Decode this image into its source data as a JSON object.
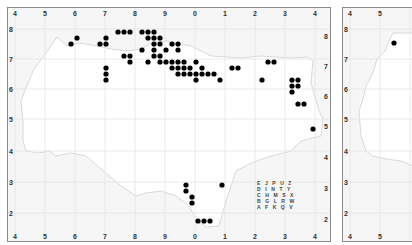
{
  "chart_data": {
    "type": "scatter",
    "title": "",
    "xlabel": "",
    "ylabel": "",
    "x_ticks": [
      "4",
      "5",
      "6",
      "7",
      "8",
      "9",
      "0",
      "1",
      "2",
      "3",
      "4"
    ],
    "y_ticks": [
      "8",
      "7",
      "6",
      "5",
      "4",
      "3",
      "2"
    ],
    "grid": true,
    "legend": null,
    "tetrad_key": [
      "E J P U Z",
      "D I N T Y",
      "C H M S X",
      "B G L R W",
      "A F K Q V"
    ],
    "series": [
      {
        "name": "records",
        "points_px": [
          [
            70,
            43
          ],
          [
            76,
            37
          ],
          [
            99,
            43
          ],
          [
            105,
            43
          ],
          [
            105,
            37
          ],
          [
            117,
            31
          ],
          [
            123,
            31
          ],
          [
            129,
            31
          ],
          [
            141,
            31
          ],
          [
            147,
            31
          ],
          [
            153,
            31
          ],
          [
            147,
            37
          ],
          [
            153,
            37
          ],
          [
            159,
            37
          ],
          [
            153,
            43
          ],
          [
            159,
            43
          ],
          [
            171,
            43
          ],
          [
            177,
            43
          ],
          [
            141,
            49
          ],
          [
            153,
            49
          ],
          [
            165,
            49
          ],
          [
            177,
            49
          ],
          [
            123,
            55
          ],
          [
            129,
            55
          ],
          [
            153,
            55
          ],
          [
            159,
            55
          ],
          [
            105,
            67
          ],
          [
            105,
            73
          ],
          [
            105,
            79
          ],
          [
            129,
            61
          ],
          [
            147,
            61
          ],
          [
            159,
            61
          ],
          [
            165,
            61
          ],
          [
            171,
            61
          ],
          [
            177,
            61
          ],
          [
            183,
            61
          ],
          [
            171,
            67
          ],
          [
            177,
            67
          ],
          [
            183,
            67
          ],
          [
            189,
            67
          ],
          [
            177,
            73
          ],
          [
            183,
            73
          ],
          [
            189,
            73
          ],
          [
            195,
            73
          ],
          [
            195,
            61
          ],
          [
            201,
            67
          ],
          [
            201,
            73
          ],
          [
            207,
            73
          ],
          [
            213,
            73
          ],
          [
            195,
            79
          ],
          [
            219,
            79
          ],
          [
            231,
            67
          ],
          [
            237,
            67
          ],
          [
            267,
            61
          ],
          [
            273,
            61
          ],
          [
            261,
            79
          ],
          [
            291,
            79
          ],
          [
            297,
            79
          ],
          [
            291,
            85
          ],
          [
            297,
            85
          ],
          [
            291,
            91
          ],
          [
            297,
            103
          ],
          [
            303,
            103
          ],
          [
            312,
            128
          ],
          [
            185,
            184
          ],
          [
            185,
            190
          ],
          [
            191,
            196
          ],
          [
            191,
            202
          ],
          [
            197,
            220
          ],
          [
            203,
            220
          ],
          [
            209,
            220
          ],
          [
            221,
            184
          ]
        ]
      },
      {
        "name": "records-panel-2",
        "points_px": [
          [
            393,
            42
          ]
        ]
      }
    ]
  },
  "panels": [
    {
      "name": "main-map",
      "x_labels": [
        "4",
        "5",
        "6",
        "7",
        "8",
        "9",
        "0",
        "1",
        "2",
        "3",
        "4"
      ],
      "y_labels": [
        "8",
        "7",
        "6",
        "5",
        "4",
        "3",
        "2"
      ]
    },
    {
      "name": "second-map",
      "x_labels": [
        "4",
        "5"
      ],
      "y_labels": [
        "8",
        "7",
        "6",
        "5",
        "4",
        "3",
        "2"
      ]
    }
  ],
  "colors": {
    "dot": "#000000",
    "grid": "#e4e4e4",
    "coast": "#d0d0d0",
    "sea": "#f6f6f6",
    "land": "#ffffff",
    "frame": "#8a8a8a"
  }
}
